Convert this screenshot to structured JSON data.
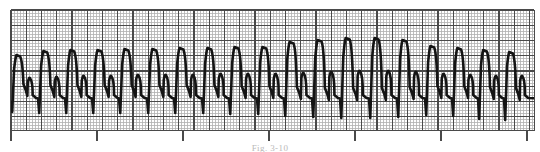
{
  "figure": {
    "kind": "ecg-rhythm-strip",
    "caption": "Fig. 3-10",
    "paper_color": "#ffffff",
    "grid_minor_color": "#b0b0b0",
    "grid_major_color": "#4a4a4a",
    "trace_color": "#141414",
    "trace_width": 2.6,
    "left_margin_px": 11,
    "right_edge_px": 534,
    "grid_top_px": 10,
    "grid_bottom_px": 130,
    "minor_step_px": 3.05,
    "major_step_px": 15.25,
    "baseline_y_px": 101,
    "axis_tick_positions": [
      11,
      97,
      183,
      269,
      355,
      441,
      527
    ],
    "axis_tick_bottom_px": 141
  },
  "chart_data": {
    "type": "line",
    "title": "",
    "subtitle": "",
    "xlabel": "",
    "ylabel": "",
    "grid": true,
    "legend": null,
    "xlim": [
      0,
      540
    ],
    "ylim": [
      130,
      10
    ],
    "series": [
      {
        "name": "ECG Lead II",
        "beat_count": 19,
        "beats": [
          {
            "x": 11,
            "q_depth": 112,
            "r_peak": 55,
            "width": 27.0,
            "notch_y": 90,
            "t_bump": 78
          },
          {
            "x": 38,
            "q_depth": 113,
            "r_peak": 51,
            "width": 27.0,
            "notch_y": 91,
            "t_bump": 77
          },
          {
            "x": 65,
            "q_depth": 113,
            "r_peak": 50,
            "width": 27.0,
            "notch_y": 91,
            "t_bump": 76
          },
          {
            "x": 92,
            "q_depth": 113,
            "r_peak": 50,
            "width": 27.5,
            "notch_y": 91,
            "t_bump": 76
          },
          {
            "x": 119,
            "q_depth": 113,
            "r_peak": 49,
            "width": 27.5,
            "notch_y": 91,
            "t_bump": 75
          },
          {
            "x": 147,
            "q_depth": 113,
            "r_peak": 49,
            "width": 27.0,
            "notch_y": 91,
            "t_bump": 75
          },
          {
            "x": 174,
            "q_depth": 113,
            "r_peak": 48,
            "width": 27.5,
            "notch_y": 91,
            "t_bump": 75
          },
          {
            "x": 202,
            "q_depth": 113,
            "r_peak": 48,
            "width": 27.0,
            "notch_y": 91,
            "t_bump": 74
          },
          {
            "x": 229,
            "q_depth": 114,
            "r_peak": 47,
            "width": 27.5,
            "notch_y": 92,
            "t_bump": 74
          },
          {
            "x": 257,
            "q_depth": 114,
            "r_peak": 47,
            "width": 27.0,
            "notch_y": 92,
            "t_bump": 74
          },
          {
            "x": 284,
            "q_depth": 116,
            "r_peak": 42,
            "width": 28.0,
            "notch_y": 93,
            "t_bump": 73
          },
          {
            "x": 312,
            "q_depth": 117,
            "r_peak": 40,
            "width": 28.0,
            "notch_y": 94,
            "t_bump": 72
          },
          {
            "x": 340,
            "q_depth": 118,
            "r_peak": 38,
            "width": 28.5,
            "notch_y": 94,
            "t_bump": 71
          },
          {
            "x": 369,
            "q_depth": 118,
            "r_peak": 38,
            "width": 28.0,
            "notch_y": 94,
            "t_bump": 71
          },
          {
            "x": 397,
            "q_depth": 117,
            "r_peak": 40,
            "width": 27.5,
            "notch_y": 93,
            "t_bump": 72
          },
          {
            "x": 425,
            "q_depth": 115,
            "r_peak": 46,
            "width": 27.0,
            "notch_y": 92,
            "t_bump": 74
          },
          {
            "x": 452,
            "q_depth": 116,
            "r_peak": 48,
            "width": 26.5,
            "notch_y": 92,
            "t_bump": 75
          },
          {
            "x": 478,
            "q_depth": 119,
            "r_peak": 50,
            "width": 26.0,
            "notch_y": 93,
            "t_bump": 76
          },
          {
            "x": 504,
            "q_depth": 120,
            "r_peak": 52,
            "width": 26.0,
            "notch_y": 94,
            "t_bump": 76
          }
        ]
      }
    ]
  }
}
